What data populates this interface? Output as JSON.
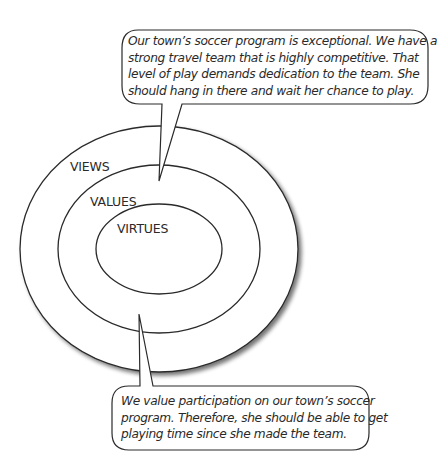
{
  "diagram": {
    "rings": [
      {
        "label": "VIEWS",
        "cx": 159,
        "cy": 249,
        "rx": 139,
        "ry": 123
      },
      {
        "label": "VALUES",
        "cx": 159,
        "cy": 249,
        "rx": 101,
        "ry": 84
      },
      {
        "label": "VIRTUES",
        "cx": 159,
        "cy": 249,
        "rx": 63,
        "ry": 45
      }
    ],
    "callouts": [
      {
        "id": "views-callout",
        "points_to": "VALUES",
        "lines": [
          "Our town’s soccer program is exceptional. We have a",
          "strong travel team that is highly competitive. That",
          "level of play demands dedication to the team. She",
          "should hang in there and wait her chance to play."
        ]
      },
      {
        "id": "values-callout",
        "points_to": "VALUES",
        "lines": [
          "We value participation on our town’s soccer",
          "program. Therefore, she should be able to get",
          "playing time since she made the team."
        ]
      }
    ],
    "colors": {
      "stroke": "#2a2a2a",
      "background": "#ffffff",
      "shadow": "#7a7a7a"
    }
  }
}
